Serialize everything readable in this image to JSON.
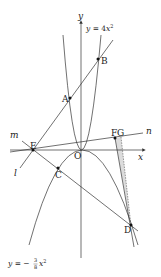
{
  "diagram": {
    "axes": {
      "x_label": "x",
      "y_label": "y",
      "origin_label": "O"
    },
    "curves": [
      {
        "id": "upper-parabola",
        "equation": "y = 4x²",
        "label_parts": {
          "prefix": "y = 4",
          "var": "x",
          "exp": "2"
        }
      },
      {
        "id": "lower-parabola",
        "equation": "y = −3/8 x²",
        "label_parts": {
          "prefix": "y = −",
          "num": "3",
          "den": "8",
          "var": "x",
          "exp": "2"
        }
      }
    ],
    "lines": [
      {
        "id": "l",
        "label": "l"
      },
      {
        "id": "m",
        "label": "m"
      },
      {
        "id": "n",
        "label": "n"
      }
    ],
    "points": [
      {
        "label": "A"
      },
      {
        "label": "B"
      },
      {
        "label": "C"
      },
      {
        "label": "D"
      },
      {
        "label": "E"
      },
      {
        "label": "F"
      },
      {
        "label": "G"
      }
    ],
    "colors": {
      "stroke": "#333333",
      "shade": "#d8d8d8"
    }
  }
}
